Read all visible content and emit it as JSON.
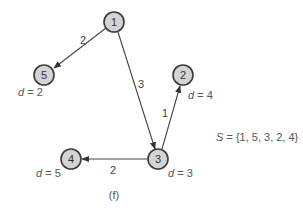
{
  "diagram": {
    "type": "directed-weighted-graph",
    "caption": "(f)",
    "set_label": {
      "symbol": "S",
      "text": " = {1, 5, 3, 2, 4}"
    },
    "nodes": [
      {
        "id": "1",
        "label": "1",
        "distance": null
      },
      {
        "id": "5",
        "label": "5",
        "distance_label": {
          "var": "d",
          "text": " = 2"
        }
      },
      {
        "id": "2",
        "label": "2",
        "distance_label": {
          "var": "d",
          "text": " = 4"
        }
      },
      {
        "id": "3",
        "label": "3",
        "distance_label": {
          "var": "d",
          "text": " = 3"
        }
      },
      {
        "id": "4",
        "label": "4",
        "distance_label": {
          "var": "d",
          "text": " = 5"
        }
      }
    ],
    "edges": [
      {
        "from": "1",
        "to": "5",
        "weight": "2"
      },
      {
        "from": "1",
        "to": "3",
        "weight": "3"
      },
      {
        "from": "3",
        "to": "2",
        "weight": "1"
      },
      {
        "from": "3",
        "to": "4",
        "weight": "2"
      }
    ]
  }
}
